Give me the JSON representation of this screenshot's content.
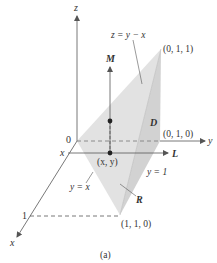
{
  "figure": {
    "caption": "(a)",
    "axes": {
      "z_label": "z",
      "x_label": "x",
      "y_label": "y",
      "origin_label": "0",
      "x_tick_label": "1",
      "x_line_label": "x"
    },
    "points": {
      "p011": "(0, 1, 1)",
      "p010": "(0, 1, 0)",
      "p110": "(1, 1, 0)",
      "pxy": "(x, y)"
    },
    "labels": {
      "surface": "z = y − x",
      "M": "M",
      "L": "L",
      "D": "D",
      "R": "R",
      "line_yx": "y = x",
      "line_y1": "y = 1"
    },
    "colors": {
      "face_light": "#e0e0e0",
      "face_dark": "#cfcfcf",
      "axis": "#555555",
      "text": "#333333"
    }
  }
}
